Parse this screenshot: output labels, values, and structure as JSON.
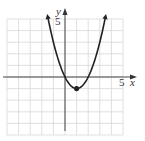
{
  "chart_data": {
    "type": "line",
    "title": "",
    "function": "y = x^2 - 2x",
    "xlabel": "x",
    "ylabel": "y",
    "x_tick_label": "5",
    "y_tick_label": "5",
    "xlim": [
      -5,
      5
    ],
    "ylim": [
      -5,
      5
    ],
    "grid": true,
    "vertex": {
      "x": 1,
      "y": -1
    },
    "x_intercepts": [
      0,
      2
    ],
    "series": [
      {
        "name": "parabola",
        "x": [
          -1.5,
          -1,
          -0.5,
          0,
          0.5,
          1,
          1.5,
          2,
          2.5,
          3,
          3.5
        ],
        "y": [
          5.25,
          3,
          1.25,
          0,
          -0.75,
          -1,
          -0.75,
          0,
          1.25,
          3,
          5.25
        ]
      }
    ],
    "colors": {
      "curve": "#222222",
      "grid": "#d8d8d8",
      "axis": "#333333"
    }
  }
}
